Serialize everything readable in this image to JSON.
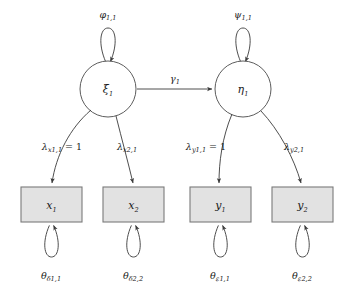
{
  "diagram": {
    "type": "path-diagram",
    "colors": {
      "box_fill": "#e2e2e2",
      "box_stroke": "#7a7a7a",
      "circle_fill": "#ffffff",
      "circle_stroke": "#4a4a4a",
      "line": "#3a3a3a",
      "text": "#1a1a1a",
      "background": "#ffffff"
    },
    "latent_variables": [
      {
        "id": "xi1",
        "label": "ξ",
        "subscript": "1",
        "cx": 108,
        "cy": 89,
        "r": 28
      },
      {
        "id": "eta1",
        "label": "η",
        "subscript": "1",
        "cx": 243,
        "cy": 89,
        "r": 28
      }
    ],
    "observed_variables": [
      {
        "id": "x1",
        "label": "x",
        "subscript": "1",
        "x": 21,
        "y": 187,
        "w": 61,
        "h": 35
      },
      {
        "id": "x2",
        "label": "x",
        "subscript": "2",
        "x": 103,
        "y": 187,
        "w": 61,
        "h": 35
      },
      {
        "id": "y1",
        "label": "y",
        "subscript": "1",
        "x": 190,
        "y": 187,
        "w": 61,
        "h": 35
      },
      {
        "id": "y2",
        "label": "y",
        "subscript": "2",
        "x": 272,
        "y": 187,
        "w": 61,
        "h": 35
      }
    ],
    "variance_labels": [
      {
        "id": "phi11",
        "symbol": "φ",
        "subscript": "1,1",
        "x": 108,
        "y": 15
      },
      {
        "id": "psi11",
        "symbol": "ψ",
        "subscript": "1,1",
        "x": 243,
        "y": 15
      }
    ],
    "loading_labels": [
      {
        "id": "lambda-x1-1",
        "symbol": "λ",
        "subscript": "x1,1",
        "suffix": " = 1",
        "x": 62,
        "y": 147
      },
      {
        "id": "lambda-x2-1",
        "symbol": "λ",
        "subscript": "x2,1",
        "suffix": "",
        "x": 127,
        "y": 147
      },
      {
        "id": "lambda-y1-1",
        "symbol": "λ",
        "subscript": "y1,1",
        "suffix": " = 1",
        "x": 206,
        "y": 147
      },
      {
        "id": "lambda-y2-1",
        "symbol": "λ",
        "subscript": "y2,1",
        "suffix": "",
        "x": 294,
        "y": 147
      }
    ],
    "structural_label": {
      "id": "gamma1",
      "symbol": "γ",
      "subscript": "1",
      "x": 175,
      "y": 80
    },
    "residual_labels": [
      {
        "id": "theta-delta-1-1",
        "symbol": "θ",
        "subscript": "δ1,1",
        "x": 51,
        "y": 277
      },
      {
        "id": "theta-delta-2-2",
        "symbol": "θ",
        "subscript": "δ2,2",
        "x": 133,
        "y": 277
      },
      {
        "id": "theta-epsilon-1-1",
        "symbol": "θ",
        "subscript": "ε1,1",
        "x": 220,
        "y": 277
      },
      {
        "id": "theta-epsilon-2-2",
        "symbol": "θ",
        "subscript": "ε2,2",
        "x": 302,
        "y": 277
      }
    ]
  }
}
